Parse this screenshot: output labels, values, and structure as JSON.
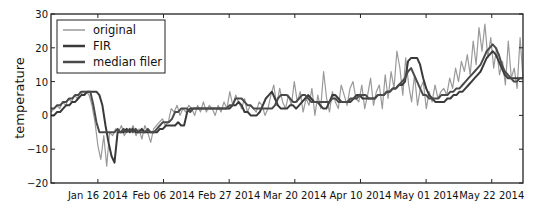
{
  "chart_data": {
    "type": "line",
    "title": "",
    "xlabel": "",
    "ylabel": "temperature",
    "ylim": [
      -20,
      30
    ],
    "yticks": [
      -20,
      -10,
      0,
      10,
      20,
      30
    ],
    "ytick_labels": [
      "−20",
      "−10",
      "0",
      "10",
      "20",
      "30"
    ],
    "x_start": "2014-01-01",
    "x_end": "2014-06-01",
    "xtick_labels": [
      "Jan 16 2014",
      "Feb 06 2014",
      "Feb 27 2014",
      "Mar 20 2014",
      "Apr 10 2014",
      "May 01 2014",
      "May 22 2014"
    ],
    "xtick_day_offsets": [
      15,
      36,
      57,
      78,
      99,
      120,
      141
    ],
    "grid": false,
    "legend_position": "upper left",
    "legend": [
      "original",
      "FIR",
      "median filer"
    ],
    "series": [
      {
        "name": "original",
        "color": "#9a9a9a",
        "width": 1.2,
        "values": [
          1,
          2,
          3,
          2,
          4,
          3,
          5,
          4,
          6,
          5,
          7,
          6,
          7,
          6,
          3,
          -2,
          -9,
          -13,
          -6,
          -15,
          -5,
          -6,
          -4,
          -5,
          -3,
          -6,
          -4,
          -5,
          -3,
          -6,
          -4,
          -7,
          -3,
          -5,
          -8,
          -4,
          -3,
          -2,
          -1,
          -3,
          -2,
          2,
          1,
          3,
          0,
          2,
          1,
          3,
          2,
          0,
          3,
          1,
          4,
          1,
          3,
          2,
          0,
          3,
          1,
          4,
          2,
          7,
          3,
          6,
          4,
          2,
          5,
          1,
          3,
          2,
          1,
          4,
          3,
          0,
          2,
          6,
          9,
          3,
          8,
          4,
          2,
          6,
          3,
          10,
          4,
          7,
          1,
          5,
          3,
          8,
          0,
          6,
          2,
          13,
          5,
          1,
          7,
          4,
          2,
          9,
          6,
          3,
          8,
          10,
          5,
          4,
          9,
          2,
          6,
          11,
          3,
          7,
          9,
          2,
          12,
          5,
          13,
          8,
          19,
          14,
          6,
          17,
          9,
          4,
          12,
          3,
          8,
          10,
          2,
          7,
          4,
          9,
          5,
          7,
          8,
          6,
          11,
          8,
          14,
          10,
          16,
          13,
          18,
          12,
          22,
          15,
          26,
          19,
          27,
          17,
          23,
          14,
          20,
          12,
          16,
          9,
          22,
          11,
          14,
          8,
          23,
          11
        ]
      },
      {
        "name": "FIR",
        "color": "#3a3a3a",
        "width": 2.0,
        "values": [
          0,
          0,
          1,
          1,
          2,
          3,
          3,
          4,
          4,
          5,
          6,
          6,
          7,
          7,
          7,
          7,
          6,
          3,
          -3,
          -8,
          -12,
          -14,
          -5,
          -5,
          -5,
          -4,
          -5,
          -4,
          -5,
          -5,
          -4,
          -5,
          -5,
          -5,
          -5,
          -5,
          -4,
          -4,
          -3,
          -3,
          -3,
          -3,
          -2,
          -3,
          -3,
          1,
          2,
          2,
          2,
          2,
          2,
          2,
          2,
          2,
          2,
          2,
          2,
          2,
          2,
          2,
          3,
          3,
          4,
          3,
          1,
          1,
          0,
          0,
          0,
          1,
          3,
          5,
          6,
          7,
          5,
          3,
          2,
          2,
          2,
          3,
          3,
          2,
          3,
          4,
          5,
          6,
          5,
          4,
          4,
          3,
          2,
          2,
          4,
          6,
          6,
          5,
          4,
          4,
          4,
          4,
          5,
          6,
          6,
          5,
          5,
          5,
          5,
          5,
          6,
          6,
          6,
          7,
          7,
          8,
          8,
          9,
          9,
          10,
          16,
          17,
          17,
          17,
          15,
          11,
          8,
          6,
          5,
          4,
          4,
          4,
          4,
          5,
          5,
          6,
          6,
          7,
          7,
          8,
          9,
          10,
          11,
          12,
          13,
          15,
          17,
          18,
          19,
          18,
          16,
          14,
          12,
          11,
          11,
          11,
          11,
          11,
          11
        ]
      },
      {
        "name": "median filer",
        "color": "#4a4a4a",
        "width": 2.0,
        "values": [
          2,
          2,
          3,
          3,
          4,
          4,
          5,
          5,
          6,
          6,
          7,
          7,
          7,
          7,
          3,
          -2,
          -5,
          -5,
          -5,
          -5,
          -5,
          -5,
          -4,
          -5,
          -4,
          -5,
          -4,
          -5,
          -4,
          -5,
          -5,
          -5,
          -4,
          -5,
          -5,
          -4,
          -3,
          -2,
          -2,
          -2,
          -1,
          1,
          1,
          2,
          2,
          2,
          1,
          2,
          2,
          2,
          2,
          2,
          2,
          2,
          2,
          2,
          2,
          2,
          2,
          3,
          3,
          5,
          5,
          5,
          4,
          3,
          3,
          2,
          2,
          2,
          2,
          2,
          2,
          2,
          3,
          5,
          6,
          6,
          6,
          5,
          4,
          4,
          5,
          6,
          6,
          5,
          4,
          4,
          4,
          4,
          4,
          4,
          4,
          5,
          5,
          4,
          4,
          4,
          4,
          5,
          5,
          5,
          6,
          6,
          6,
          5,
          5,
          5,
          6,
          6,
          6,
          7,
          7,
          8,
          8,
          9,
          10,
          11,
          13,
          14,
          12,
          10,
          8,
          6,
          6,
          5,
          5,
          5,
          5,
          6,
          6,
          6,
          7,
          7,
          8,
          8,
          9,
          10,
          11,
          12,
          13,
          14,
          15,
          17,
          19,
          20,
          21,
          20,
          18,
          15,
          13,
          12,
          11,
          10,
          10,
          11,
          11
        ]
      }
    ]
  }
}
